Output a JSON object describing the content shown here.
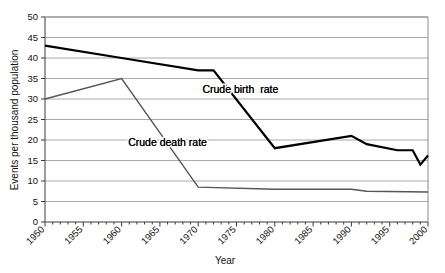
{
  "chart_data": {
    "type": "line",
    "title": "",
    "xlabel": "Year",
    "ylabel": "Events per thousand population",
    "xlim": [
      1950,
      2000
    ],
    "ylim": [
      0,
      50
    ],
    "ytick_step": 5,
    "xtick_step": 5,
    "xminor_step": 1,
    "grid": "horizontal",
    "legend_position": "inline-annotation",
    "yticks": [
      "0",
      "5",
      "10",
      "15",
      "20",
      "25",
      "30",
      "35",
      "40",
      "45",
      "50"
    ],
    "xticks": [
      "1950",
      "1955",
      "1960",
      "1965",
      "1970",
      "1975",
      "1980",
      "1985",
      "1990",
      "1995",
      "2000"
    ],
    "series": [
      {
        "name": "Crude birth  rate",
        "color": "#000000",
        "width": 2.2,
        "x": [
          1950,
          1960,
          1970,
          1972,
          1980,
          1990,
          1992,
          1996,
          1998,
          1999,
          2000
        ],
        "values": [
          43,
          40,
          37,
          37,
          18,
          21,
          19,
          17.5,
          17.5,
          14,
          16.2
        ]
      },
      {
        "name": "Crude death rate",
        "color": "#555555",
        "width": 1.4,
        "x": [
          1950,
          1960,
          1970,
          1980,
          1990,
          1992,
          2000
        ],
        "values": [
          30,
          35,
          8.5,
          8,
          8,
          7.5,
          7.3
        ]
      }
    ],
    "annotations": [
      {
        "text": "Crude birth  rate",
        "x": 1975.5,
        "y": 31.5
      },
      {
        "text": "Crude death rate",
        "x": 1966.0,
        "y": 18.5
      }
    ]
  }
}
